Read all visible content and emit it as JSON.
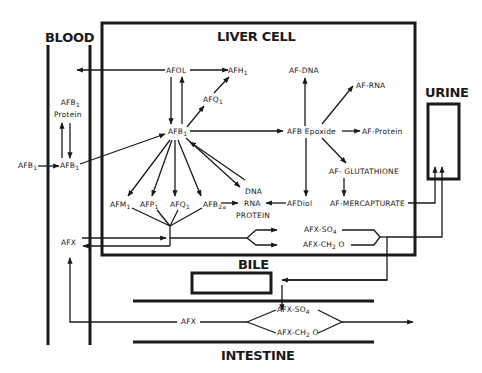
{
  "compartments": {
    "blood": "BLOOD",
    "liver_cell": "LIVER CELL",
    "urine": "URINE",
    "bile": "BILE",
    "intestine": "INTESTINE"
  },
  "nodes": {
    "afb1_blood_in": {
      "base": "AFB",
      "sub": "1"
    },
    "afb1_blood": {
      "base": "AFB",
      "sub": "1"
    },
    "afb1_protein_top": {
      "base": "AFB",
      "sub": "1"
    },
    "afb1_protein_bottom": "Protein",
    "afol": "AFOL",
    "afh1": {
      "base": "AFH",
      "sub": "1"
    },
    "afq1_upper": {
      "base": "AFQ",
      "sub": "1"
    },
    "afb1_liver": {
      "base": "AFB",
      "sub": "1"
    },
    "afm1": {
      "base": "AFM",
      "sub": "1"
    },
    "afp1": {
      "base": "AFP",
      "sub": "1"
    },
    "afq1_lower": {
      "base": "AFQ",
      "sub": "1"
    },
    "afb2a": {
      "base": "AFB",
      "sub": "2a"
    },
    "dna": "DNA",
    "rna": "RNA",
    "protein": "PROTEIN",
    "af_dna": "AF-DNA",
    "af_rna": "AF-RNA",
    "afb_epoxide": "AFB Epoxide",
    "af_protein": "AF-Protein",
    "af_glutathione": "AF-  GLUTATHIONE",
    "afdiol": "AFDiol",
    "af_mercapturate": "AF-MERCAPTURATE",
    "afx_so4_liver": {
      "base": "AFX-SO",
      "sub": "4"
    },
    "afx_ch2o_liver": {
      "base": "AFX-CH",
      "sub": "2",
      "tail": " O"
    },
    "afx_blood": "AFX",
    "afx_intestine": "AFX",
    "afx_so4_int": {
      "base": "AFX-SO",
      "sub": "4"
    },
    "afx_ch2o_int": {
      "base": "AFX-CH",
      "sub": "2",
      "tail": " O"
    }
  },
  "style": {
    "ink": "#1a1a1a",
    "background": "#ffffff"
  }
}
